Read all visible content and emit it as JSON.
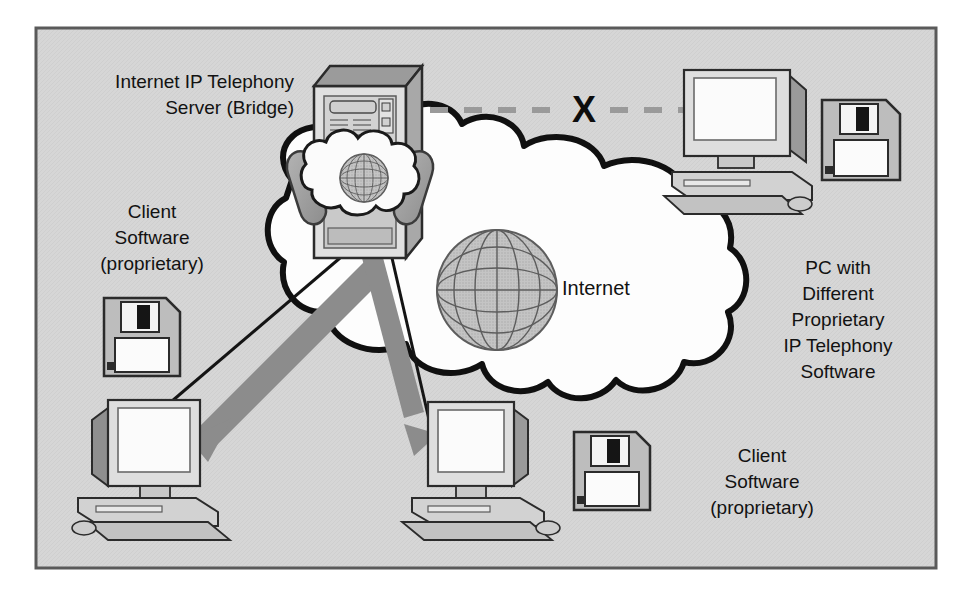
{
  "figure": {
    "kind": "network-diagram",
    "background_color": "#ffffff",
    "panel_color": "#d6d6d6",
    "panel_border_color": "#5a5a5a",
    "panel": {
      "x": 36,
      "y": 28,
      "width": 900,
      "height": 540
    }
  },
  "labels": {
    "server": {
      "name": "server-label",
      "lines": [
        "Internet IP Telephony",
        "Server (Bridge)"
      ],
      "align": "right",
      "x": 294,
      "y": 82
    },
    "client_left": {
      "name": "client-left-label",
      "lines": [
        "Client",
        "Software",
        "(proprietary)"
      ],
      "align": "center",
      "x": 152,
      "y": 212
    },
    "pc_right": {
      "name": "pc-right-label",
      "lines": [
        "PC with",
        "Different",
        "Proprietary",
        "IP Telephony",
        "Software"
      ],
      "align": "center",
      "x": 838,
      "y": 268
    },
    "client_bottom": {
      "name": "client-bottom-label",
      "lines": [
        "Client",
        "Software",
        "(proprietary)"
      ],
      "align": "center",
      "x": 762,
      "y": 455
    },
    "internet": {
      "name": "internet-label",
      "text": "Internet",
      "x": 562,
      "y": 295
    },
    "blocked_marker": {
      "name": "blocked-x-marker",
      "text": "X",
      "x": 584,
      "y": 105
    }
  },
  "nodes": [
    {
      "name": "ip-telephony-server-tower",
      "type": "server-tower",
      "label_ref": "server",
      "x": 314,
      "y": 68,
      "width": 92,
      "height": 190
    },
    {
      "name": "cloud-internet",
      "type": "cloud",
      "label_ref": "internet",
      "cx": 500,
      "cy": 280
    },
    {
      "name": "globe-internet",
      "type": "globe",
      "cx": 497,
      "cy": 290,
      "r": 60
    },
    {
      "name": "globe-server-badge",
      "type": "globe",
      "cx": 364,
      "cy": 178,
      "r": 24
    },
    {
      "name": "telephone-handset-left",
      "type": "handset",
      "side": "left"
    },
    {
      "name": "telephone-handset-right",
      "type": "handset",
      "side": "right"
    },
    {
      "name": "pc-right-different-software",
      "type": "desktop-computer",
      "x": 672,
      "y": 62,
      "width": 140,
      "height": 130
    },
    {
      "name": "pc-bottom-left-client",
      "type": "desktop-computer",
      "x": 76,
      "y": 392,
      "width": 170,
      "height": 140
    },
    {
      "name": "pc-bottom-center-client",
      "type": "desktop-computer",
      "x": 420,
      "y": 400,
      "width": 160,
      "height": 132
    },
    {
      "name": "floppy-disk-top-right",
      "type": "floppy-disk",
      "x": 822,
      "y": 100,
      "width": 78,
      "height": 80
    },
    {
      "name": "floppy-disk-left",
      "type": "floppy-disk",
      "x": 104,
      "y": 298,
      "width": 76,
      "height": 78
    },
    {
      "name": "floppy-disk-bottom",
      "type": "floppy-disk",
      "x": 574,
      "y": 432,
      "width": 76,
      "height": 78
    }
  ],
  "connections": [
    {
      "name": "blocked-link-server-to-pc-right",
      "style": "dashed",
      "color": "#9a9a9a",
      "blocked": true,
      "from": "ip-telephony-server-tower",
      "to": "pc-right-different-software"
    },
    {
      "name": "arrow-server-to-pc-bottom-left",
      "style": "solid-arrow",
      "color": "#8c8c8c",
      "from": "ip-telephony-server-tower",
      "to": "pc-bottom-left-client"
    },
    {
      "name": "arrow-server-to-pc-bottom-center",
      "style": "solid-arrow",
      "color": "#8c8c8c",
      "from": "ip-telephony-server-tower",
      "to": "pc-bottom-center-client"
    }
  ],
  "colors": {
    "panel_fill": "#d6d6d6",
    "panel_stroke": "#5a5a5a",
    "cloud_fill": "#fdfdfd",
    "cloud_stroke": "#101010",
    "globe_fill": "#b9b9b9",
    "globe_stroke": "#5d5d5d",
    "arrow_gray": "#8c8c8c",
    "dash_gray": "#9a9a9a",
    "device_light": "#e9e9e9",
    "device_mid": "#bdbdbd",
    "device_dark": "#8f8f8f",
    "outline": "#2b2b2b",
    "screen": "#fbfbfb",
    "text": "#121212"
  }
}
